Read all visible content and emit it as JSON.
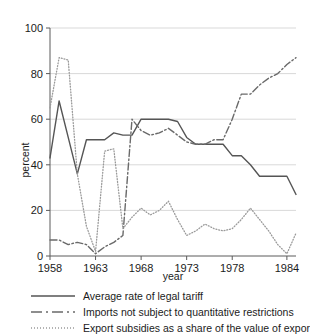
{
  "chart_data": {
    "type": "line",
    "title": "",
    "xlabel": "year",
    "ylabel": "percent",
    "xlim": [
      1958,
      1985
    ],
    "ylim": [
      0,
      100
    ],
    "xticks": [
      1958,
      1963,
      1968,
      1973,
      1978,
      1984
    ],
    "yticks": [
      0,
      20,
      40,
      60,
      80,
      100
    ],
    "grid": "horizontal",
    "legend_position": "below",
    "series": [
      {
        "name": "Average rate of legal tariff",
        "style": "solid",
        "color": "#555555",
        "x": [
          1958,
          1959,
          1960,
          1961,
          1962,
          1963,
          1964,
          1965,
          1966,
          1967,
          1968,
          1969,
          1970,
          1971,
          1972,
          1973,
          1974,
          1975,
          1976,
          1977,
          1978,
          1979,
          1980,
          1981,
          1982,
          1983,
          1984,
          1985
        ],
        "values": [
          43,
          68,
          52,
          36,
          51,
          51,
          51,
          54,
          53,
          53,
          60,
          60,
          60,
          60,
          59,
          52,
          49,
          49,
          49,
          49,
          44,
          44,
          40,
          35,
          35,
          35,
          35,
          27
        ]
      },
      {
        "name": "Imports not subject to quantitative restrictions",
        "style": "dash-dot",
        "color": "#6a6a6a",
        "x": [
          1958,
          1959,
          1960,
          1961,
          1962,
          1963,
          1964,
          1965,
          1966,
          1967,
          1968,
          1969,
          1970,
          1971,
          1972,
          1973,
          1974,
          1975,
          1976,
          1977,
          1978,
          1979,
          1980,
          1981,
          1982,
          1983,
          1984,
          1985
        ],
        "values": [
          7,
          7,
          5,
          6,
          5,
          1,
          4,
          6,
          9,
          60,
          55,
          53,
          54,
          56,
          53,
          50,
          49,
          49,
          51,
          51,
          60,
          71,
          71,
          75,
          78,
          80,
          84,
          87
        ]
      },
      {
        "name": "Export subsidies as a share of the value of exports",
        "style": "dotted",
        "color": "#9a9a9a",
        "x": [
          1958,
          1959,
          1960,
          1961,
          1962,
          1963,
          1964,
          1965,
          1966,
          1967,
          1968,
          1969,
          1970,
          1971,
          1972,
          1973,
          1974,
          1975,
          1976,
          1977,
          1978,
          1979,
          1980,
          1981,
          1982,
          1983,
          1984,
          1985
        ],
        "values": [
          65,
          87,
          86,
          36,
          13,
          2,
          46,
          47,
          12,
          17,
          21,
          18,
          20,
          24,
          16,
          9,
          11,
          14,
          12,
          11,
          12,
          16,
          21,
          16,
          11,
          5,
          1,
          10
        ]
      }
    ]
  },
  "axes": {
    "y_title": "percent",
    "x_title": "year",
    "y_tick_labels": [
      "0",
      "20",
      "40",
      "60",
      "80",
      "100"
    ],
    "x_tick_labels": [
      "1958",
      "1963",
      "1968",
      "1973",
      "1978",
      "1984"
    ]
  },
  "legend": {
    "items": [
      {
        "label": "Average rate of legal tariff",
        "style": "solid"
      },
      {
        "label": "Imports not subject to quantitative restrictions",
        "style": "dash-dot"
      },
      {
        "label": "Export subsidies as a share of the value of exports",
        "style": "dotted"
      }
    ]
  }
}
